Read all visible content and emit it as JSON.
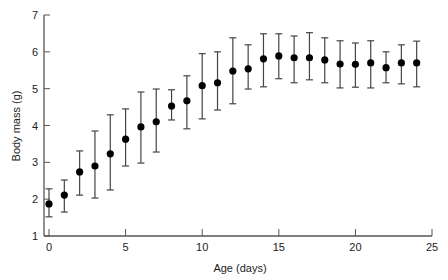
{
  "chart_data": {
    "type": "scatter",
    "title": "",
    "xlabel": "Age (days)",
    "ylabel": "Body mass (g)",
    "xlim": [
      0,
      25
    ],
    "ylim": [
      1,
      7
    ],
    "x_ticks": [
      0,
      5,
      10,
      15,
      20,
      25
    ],
    "y_ticks": [
      1,
      2,
      3,
      4,
      5,
      6,
      7
    ],
    "grid": false,
    "legend": null,
    "error_bars": true,
    "series": [
      {
        "name": "Body mass",
        "marker": "filled-circle",
        "color": "#000000",
        "points": [
          {
            "x": 0,
            "y": 1.87,
            "lower": 1.52,
            "upper": 2.28
          },
          {
            "x": 1,
            "y": 2.11,
            "lower": 1.65,
            "upper": 2.52
          },
          {
            "x": 2,
            "y": 2.74,
            "lower": 2.11,
            "upper": 3.31
          },
          {
            "x": 3,
            "y": 2.9,
            "lower": 2.03,
            "upper": 3.85
          },
          {
            "x": 4,
            "y": 3.23,
            "lower": 2.25,
            "upper": 4.29
          },
          {
            "x": 5,
            "y": 3.63,
            "lower": 2.9,
            "upper": 4.45
          },
          {
            "x": 6,
            "y": 3.96,
            "lower": 2.98,
            "upper": 4.91
          },
          {
            "x": 7,
            "y": 4.1,
            "lower": 3.28,
            "upper": 4.99
          },
          {
            "x": 8,
            "y": 4.53,
            "lower": 4.15,
            "upper": 4.97
          },
          {
            "x": 9,
            "y": 4.67,
            "lower": 3.91,
            "upper": 5.35
          },
          {
            "x": 10,
            "y": 5.08,
            "lower": 4.18,
            "upper": 5.95
          },
          {
            "x": 11,
            "y": 5.16,
            "lower": 4.42,
            "upper": 6.0
          },
          {
            "x": 12,
            "y": 5.48,
            "lower": 4.59,
            "upper": 6.38
          },
          {
            "x": 13,
            "y": 5.54,
            "lower": 4.99,
            "upper": 6.19
          },
          {
            "x": 14,
            "y": 5.81,
            "lower": 5.05,
            "upper": 6.49
          },
          {
            "x": 15,
            "y": 5.89,
            "lower": 5.27,
            "upper": 6.49
          },
          {
            "x": 16,
            "y": 5.84,
            "lower": 5.16,
            "upper": 6.43
          },
          {
            "x": 17,
            "y": 5.84,
            "lower": 5.24,
            "upper": 6.52
          },
          {
            "x": 18,
            "y": 5.78,
            "lower": 5.16,
            "upper": 6.38
          },
          {
            "x": 19,
            "y": 5.67,
            "lower": 5.02,
            "upper": 6.3
          },
          {
            "x": 20,
            "y": 5.66,
            "lower": 5.04,
            "upper": 6.24
          },
          {
            "x": 21,
            "y": 5.7,
            "lower": 5.02,
            "upper": 6.3
          },
          {
            "x": 22,
            "y": 5.57,
            "lower": 5.16,
            "upper": 6.0
          },
          {
            "x": 23,
            "y": 5.7,
            "lower": 5.13,
            "upper": 6.19
          },
          {
            "x": 24,
            "y": 5.7,
            "lower": 5.05,
            "upper": 6.29
          }
        ]
      }
    ]
  },
  "colors": {
    "axis": "#555555",
    "errorbar": "#444444",
    "marker": "#000000",
    "text": "#222222"
  }
}
